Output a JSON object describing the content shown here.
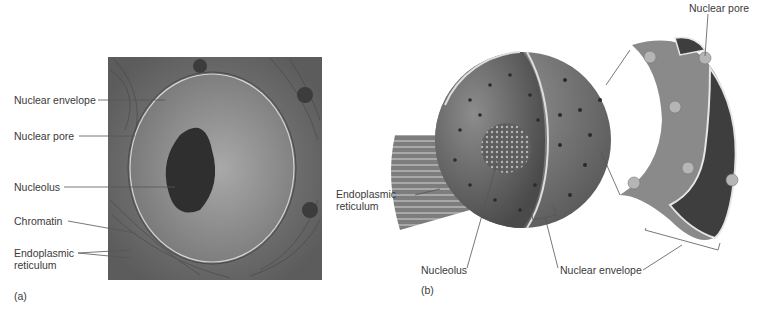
{
  "figure": {
    "panel_a": {
      "tag": "(a)",
      "type": "electron micrograph",
      "labels": {
        "nuclear_envelope": "Nuclear envelope",
        "nuclear_pore": "Nuclear pore",
        "nucleolus": "Nucleolus",
        "chromatin": "Chromatin",
        "er_line1": "Endoplasmic",
        "er_line2": "reticulum"
      }
    },
    "panel_b": {
      "tag": "(b)",
      "type": "illustration",
      "labels": {
        "er_line1": "Endoplasmic",
        "er_line2": "reticulum",
        "nucleolus": "Nucleolus",
        "nuclear_envelope": "Nuclear envelope",
        "nuclear_pore": "Nuclear pore"
      }
    }
  }
}
